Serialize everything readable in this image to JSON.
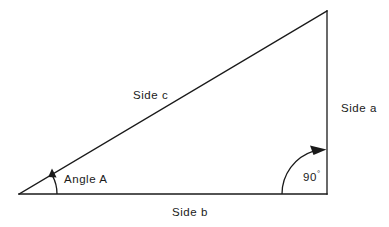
{
  "figure": {
    "kind": "right-triangle-geometry-diagram",
    "background_color": "#ffffff",
    "stroke_color": "#1a1a1a",
    "text_color": "#1a1a1a"
  },
  "labels": {
    "side_c": "Side c",
    "side_a": "Side a",
    "side_b": "Side b",
    "angle_a": "Angle A",
    "right_angle_value": "90",
    "degree_symbol": "°"
  },
  "geometry": {
    "vertices": {
      "left": {
        "x": 19,
        "y": 194
      },
      "bottom_right": {
        "x": 327,
        "y": 194
      },
      "top": {
        "x": 327,
        "y": 11
      }
    },
    "sides": [
      {
        "name": "side-b",
        "label": "Side b",
        "from": "left",
        "to": "bottom_right",
        "orientation": "horizontal"
      },
      {
        "name": "side-a",
        "label": "Side a",
        "from": "bottom_right",
        "to": "top",
        "orientation": "vertical"
      },
      {
        "name": "side-c",
        "label": "Side c",
        "from": "left",
        "to": "top",
        "orientation": "hypotenuse"
      }
    ],
    "angle_markers": [
      {
        "name": "angle-a-arc",
        "label": "Angle A",
        "vertex": "left",
        "radius": 38,
        "arrow": "up"
      },
      {
        "name": "right-angle-arc",
        "label": "90°",
        "vertex": "bottom_right",
        "radius": 45,
        "arrow": "right"
      }
    ]
  }
}
